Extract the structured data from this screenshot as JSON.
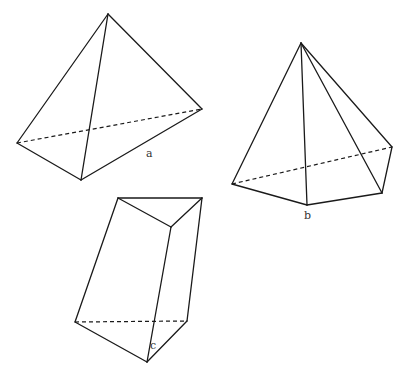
{
  "figures": [
    {
      "id": "a",
      "label": "a",
      "type": "triangular-pyramid",
      "vertices": {
        "apex": [
          108,
          14
        ],
        "left": [
          17,
          143
        ],
        "bottom": [
          81,
          180
        ],
        "right": [
          202,
          109
        ]
      },
      "label_pos": [
        146,
        147
      ]
    },
    {
      "id": "b",
      "label": "b",
      "type": "pentagonal-pyramid",
      "vertices": {
        "apex": [
          301,
          43
        ],
        "left": [
          232,
          184
        ],
        "front": [
          307,
          205
        ],
        "front_right": [
          382,
          193
        ],
        "back_right": [
          392,
          147
        ]
      },
      "label_pos": [
        304,
        209
      ]
    },
    {
      "id": "c",
      "label": "c",
      "type": "triangular-prism",
      "vertices": {
        "top_left": [
          118,
          198
        ],
        "top_right": [
          202,
          198
        ],
        "top_front": [
          171,
          227
        ],
        "bottom_left": [
          75,
          322
        ],
        "bottom_right": [
          187,
          321
        ],
        "bottom_front": [
          147,
          362
        ]
      },
      "label_pos": [
        150,
        339
      ]
    }
  ],
  "colors": {
    "line": "#1a1a1a",
    "background": "#ffffff"
  }
}
